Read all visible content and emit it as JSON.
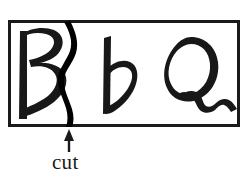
{
  "figure": {
    "type": "scanned-handwriting-figure",
    "background_color": "#ffffff",
    "ink_color": "#181818",
    "border": {
      "name": "rectangular-frame",
      "x": 8,
      "y": 20,
      "width": 232,
      "height": 107,
      "stroke_width": 3,
      "color": "#1a1a1a"
    },
    "glyphs": [
      {
        "id": "glyph-capital-b",
        "label": "B",
        "description": "hand-drawn capital letter B",
        "x": 14,
        "y": 28,
        "width": 52,
        "height": 92
      },
      {
        "id": "glyph-cut-stroke",
        "label": ")",
        "description": "thick wavy vertical pen stroke cutting through the capital B, spanning full frame height",
        "x": 62,
        "y": 20,
        "width": 18,
        "height": 107
      },
      {
        "id": "glyph-lowercase-b",
        "label": "b",
        "description": "hand-drawn lowercase letter b",
        "x": 102,
        "y": 36,
        "width": 36,
        "height": 80
      },
      {
        "id": "glyph-capital-q",
        "label": "Q",
        "description": "hand-drawn capital letter Q: rough circle with squiggly zigzag tail extending to the right frame edge",
        "x": 165,
        "y": 36,
        "width": 72,
        "height": 76
      }
    ],
    "annotation": {
      "name": "cut-annotation",
      "label": "cut",
      "arrow": {
        "name": "cut-arrow",
        "direction": "up",
        "tip_x": 69,
        "tip_y": 130,
        "tail_x": 69,
        "tail_y": 151,
        "head_width": 9,
        "head_height": 11,
        "shaft_width": 2,
        "color": "#1a1a1a"
      },
      "text_x": 52,
      "text_y": 150,
      "font_size": 21,
      "color": "#1a1a1a"
    }
  }
}
